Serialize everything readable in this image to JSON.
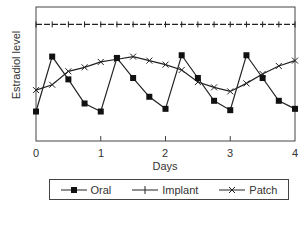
{
  "chart_data": {
    "type": "line",
    "title": "",
    "xlabel": "Days",
    "ylabel": "Estradiol level",
    "xlim": [
      0,
      4
    ],
    "x_ticks": [
      "0",
      "1",
      "2",
      "3",
      "4"
    ],
    "y_ticks": [],
    "grid": false,
    "legend_position": "bottom",
    "x": [
      0,
      0.25,
      0.5,
      0.75,
      1.0,
      1.25,
      1.5,
      1.75,
      2.0,
      2.25,
      2.5,
      2.75,
      3.0,
      3.25,
      3.5,
      3.75,
      4.0
    ],
    "series": [
      {
        "name": "Oral",
        "marker": "square",
        "values": [
          0.22,
          0.63,
          0.46,
          0.28,
          0.22,
          0.62,
          0.47,
          0.33,
          0.24,
          0.64,
          0.47,
          0.3,
          0.23,
          0.64,
          0.47,
          0.3,
          0.24
        ]
      },
      {
        "name": "Implant",
        "marker": "plus",
        "values": [
          0.87,
          0.87,
          0.87,
          0.87,
          0.87,
          0.87,
          0.87,
          0.87,
          0.87,
          0.87,
          0.87,
          0.87,
          0.87,
          0.87,
          0.87,
          0.87,
          0.87
        ]
      },
      {
        "name": "Patch",
        "marker": "x",
        "values": [
          0.38,
          0.42,
          0.52,
          0.55,
          0.59,
          0.61,
          0.63,
          0.6,
          0.57,
          0.53,
          0.44,
          0.4,
          0.37,
          0.43,
          0.5,
          0.56,
          0.6
        ]
      }
    ]
  },
  "labels": {
    "ylabel": "Estradiol level",
    "xlabel": "Days",
    "ticks": [
      "0",
      "1",
      "2",
      "3",
      "4"
    ]
  },
  "legend": {
    "items": [
      {
        "label": "Oral",
        "icon": "line-square-marker-icon"
      },
      {
        "label": "Implant",
        "icon": "line-plus-marker-icon"
      },
      {
        "label": "Patch",
        "icon": "line-x-marker-icon"
      }
    ]
  }
}
